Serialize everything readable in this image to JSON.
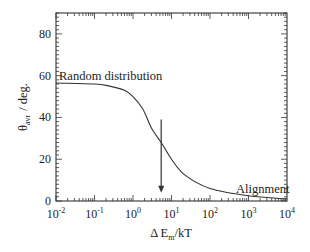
{
  "chart_data": {
    "type": "line",
    "title": "",
    "xlabel": "Δ E_m/kT",
    "ylabel": "θ_avr / deg.",
    "xscale": "log",
    "xlim": [
      0.01,
      10000
    ],
    "ylim": [
      0,
      90
    ],
    "x_ticks": [
      "10-2",
      "10-1",
      "100",
      "101",
      "102",
      "103",
      "104"
    ],
    "x_tick_exponents": [
      "-2",
      "-1",
      "0",
      "1",
      "2",
      "3",
      "4"
    ],
    "y_ticks": [
      "0",
      "20",
      "40",
      "60",
      "80"
    ],
    "grid": false,
    "legend": null,
    "series": [
      {
        "name": "θ_avr",
        "x": [
          0.01,
          0.1,
          0.25,
          0.6,
          1.0,
          1.8,
          3.0,
          5.4,
          10,
          22,
          100,
          1000,
          10000
        ],
        "y": [
          56.5,
          56,
          55,
          53,
          50,
          44,
          35,
          28,
          20,
          12.5,
          6,
          2.5,
          1
        ]
      }
    ],
    "annotations": [
      {
        "text": "Random distribution",
        "x": 0.01,
        "y": 60
      },
      {
        "text": "Alignment",
        "x": 1500,
        "y": 7
      },
      {
        "type": "arrow",
        "x": 5.4,
        "y_from": 39,
        "y_to": 4
      }
    ]
  },
  "labels": {
    "random": "Random distribution",
    "alignment": "Alignment",
    "ylabel_theta": "θ",
    "ylabel_sub": "avr",
    "ylabel_unit": "/  deg.",
    "xlabel_delta": "Δ E",
    "xlabel_sub": "m",
    "xlabel_rest": "/kT",
    "x_tick_base": "10"
  },
  "colors": {
    "line": "#333333",
    "axis": "#333333",
    "text": "#222222"
  }
}
